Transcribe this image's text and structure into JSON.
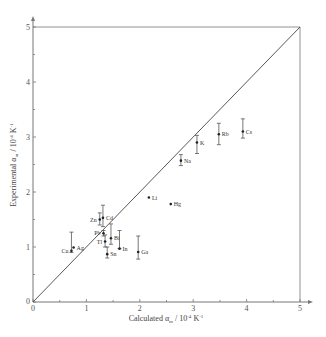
{
  "chart_data": {
    "type": "scatter",
    "title": "",
    "xlabel": "Calculated α_m / 10⁻⁴ K⁻¹",
    "ylabel": "Experimental α_m / 10⁻⁴ K⁻¹",
    "xlim": [
      0,
      5
    ],
    "ylim": [
      0,
      5
    ],
    "x_ticks": [
      "0",
      "1",
      "2",
      "3",
      "4",
      "5"
    ],
    "y_ticks": [
      "0",
      "1",
      "2",
      "3",
      "4",
      "5"
    ],
    "grid": false,
    "reference_line": {
      "type": "y=x",
      "from": [
        0,
        0
      ],
      "to": [
        5,
        5
      ]
    },
    "points": [
      {
        "label": "Cu",
        "x": 0.72,
        "y": 0.93,
        "err_low": 0.9,
        "err_high": 1.27,
        "label_side": "left"
      },
      {
        "label": "Ag",
        "x": 0.76,
        "y": 0.99,
        "err_low": null,
        "err_high": null,
        "label_side": "right"
      },
      {
        "label": "Zn",
        "x": 1.25,
        "y": 1.5,
        "err_low": 1.4,
        "err_high": 1.62,
        "label_side": "left"
      },
      {
        "label": "Cd",
        "x": 1.31,
        "y": 1.53,
        "err_low": 1.37,
        "err_high": 1.76,
        "label_side": "right"
      },
      {
        "label": "Pb",
        "x": 1.32,
        "y": 1.25,
        "err_low": 1.2,
        "err_high": 1.3,
        "label_side": "left"
      },
      {
        "label": "Bi",
        "x": 1.46,
        "y": 1.16,
        "err_low": 1.05,
        "err_high": 1.42,
        "label_side": "right"
      },
      {
        "label": "Tl",
        "x": 1.35,
        "y": 1.1,
        "err_low": 1.0,
        "err_high": 1.22,
        "label_side": "left"
      },
      {
        "label": "Sn",
        "x": 1.39,
        "y": 0.87,
        "err_low": 0.8,
        "err_high": 1.0,
        "label_side": "right"
      },
      {
        "label": "In",
        "x": 1.62,
        "y": 0.97,
        "err_low": 0.97,
        "err_high": 1.3,
        "label_side": "right"
      },
      {
        "label": "Ga",
        "x": 1.97,
        "y": 0.91,
        "err_low": 0.78,
        "err_high": 1.2,
        "label_side": "right"
      },
      {
        "label": "Li",
        "x": 2.17,
        "y": 1.9,
        "err_low": null,
        "err_high": null,
        "label_side": "right"
      },
      {
        "label": "Hg",
        "x": 2.58,
        "y": 1.78,
        "err_low": null,
        "err_high": null,
        "label_side": "right"
      },
      {
        "label": "Na",
        "x": 2.77,
        "y": 2.57,
        "err_low": 2.48,
        "err_high": 2.68,
        "label_side": "right"
      },
      {
        "label": "K",
        "x": 3.07,
        "y": 2.9,
        "err_low": 2.7,
        "err_high": 3.03,
        "label_side": "right"
      },
      {
        "label": "Rb",
        "x": 3.48,
        "y": 3.05,
        "err_low": 2.86,
        "err_high": 3.25,
        "label_side": "right"
      },
      {
        "label": "Cs",
        "x": 3.93,
        "y": 3.1,
        "err_low": 2.98,
        "err_high": 3.33,
        "label_side": "right"
      }
    ]
  },
  "axes": {
    "x_title": "Calculated α",
    "x_title_sub": "m",
    "x_title_unit": " / 10",
    "x_title_exp": "-4",
    "x_title_k": " K",
    "x_title_kexp": "-1",
    "y_title": "Experimental α",
    "y_title_sub": "m",
    "y_title_unit": " / 10",
    "y_title_exp": "-4",
    "y_title_k": " K",
    "y_title_kexp": "-1"
  },
  "colors": {
    "axis": "#777777",
    "line": "#444444",
    "point": "#222222",
    "error": "#555555"
  }
}
